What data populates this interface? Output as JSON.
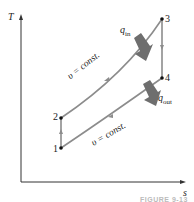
{
  "diagram": {
    "type": "T-s diagram (Otto cycle)",
    "axes": {
      "y_label": "T",
      "x_label": "s"
    },
    "states": [
      {
        "id": "1",
        "label": "1"
      },
      {
        "id": "2",
        "label": "2"
      },
      {
        "id": "3",
        "label": "3"
      },
      {
        "id": "4",
        "label": "4"
      }
    ],
    "process_labels": {
      "upper": "υ = const.",
      "lower": "υ = const."
    },
    "heat": {
      "in": "q",
      "in_sub": "in",
      "out": "q",
      "out_sub": "out"
    },
    "caption": "FIGURE 9-13",
    "colors": {
      "process_line": "#8c8c8c",
      "heat_arrow": "#6e6e6e",
      "axis": "#333333"
    }
  }
}
